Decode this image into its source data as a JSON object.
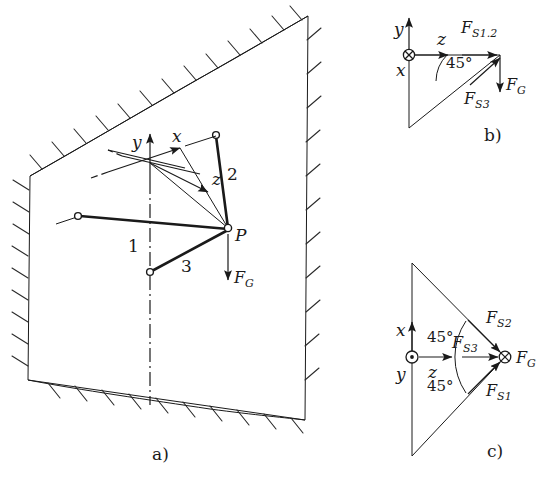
{
  "figure": {
    "colors": {
      "ink": "#1a1a1a",
      "background": "#ffffff",
      "hatch": "#2a2a2a"
    },
    "panels": [
      {
        "id": "a",
        "caption": "a)",
        "description": "Spatial three-bar linkage attached to a hatched wall plane",
        "axes": [
          {
            "name": "y-axis",
            "label": "y",
            "direction": "up"
          },
          {
            "name": "x-axis",
            "label": "x",
            "direction": "up-right"
          },
          {
            "name": "z-axis",
            "label": "z",
            "direction": "down-right"
          }
        ],
        "point_labels": [
          {
            "name": "point-p",
            "label": "P"
          }
        ],
        "bar_labels": [
          {
            "name": "bar-1",
            "label": "1"
          },
          {
            "name": "bar-2",
            "label": "2"
          },
          {
            "name": "bar-3",
            "label": "3"
          }
        ],
        "forces": [
          {
            "name": "weight-force",
            "label": "F",
            "sub": "G",
            "direction": "down"
          }
        ]
      },
      {
        "id": "b",
        "caption": "b)",
        "description": "Side view force triangle in the y-z plane",
        "axes": [
          {
            "name": "y-axis",
            "label": "y",
            "direction": "up"
          },
          {
            "name": "z-axis",
            "label": "z",
            "direction": "right"
          },
          {
            "name": "x-axis",
            "label": "x",
            "direction": "into-page",
            "symbol": "circle-cross"
          }
        ],
        "angles": [
          {
            "name": "angle-45",
            "label": "45°"
          }
        ],
        "forces": [
          {
            "name": "force-s12",
            "label": "F",
            "sub": "S1.2",
            "direction": "right"
          },
          {
            "name": "force-s3",
            "label": "F",
            "sub": "S3",
            "direction": "up-right-45"
          },
          {
            "name": "weight-force",
            "label": "F",
            "sub": "G",
            "direction": "down"
          }
        ]
      },
      {
        "id": "c",
        "caption": "c)",
        "description": "Top view force diagram in the x-z plane",
        "axes": [
          {
            "name": "x-axis",
            "label": "x",
            "direction": "up"
          },
          {
            "name": "z-axis",
            "label": "z",
            "direction": "right"
          },
          {
            "name": "y-axis",
            "label": "y",
            "direction": "out-of-page",
            "symbol": "circle-dot"
          }
        ],
        "angles": [
          {
            "name": "angle-45-upper",
            "label": "45°"
          },
          {
            "name": "angle-45-lower",
            "label": "45°"
          }
        ],
        "forces": [
          {
            "name": "force-s2",
            "label": "F",
            "sub": "S2",
            "direction": "down-right-45"
          },
          {
            "name": "force-s3",
            "label": "F",
            "sub": "S3",
            "direction": "right"
          },
          {
            "name": "force-s1",
            "label": "F",
            "sub": "S1",
            "direction": "up-right-45"
          },
          {
            "name": "weight-force",
            "label": "F",
            "sub": "G",
            "direction": "into-page",
            "symbol": "circle-cross"
          }
        ]
      }
    ]
  }
}
